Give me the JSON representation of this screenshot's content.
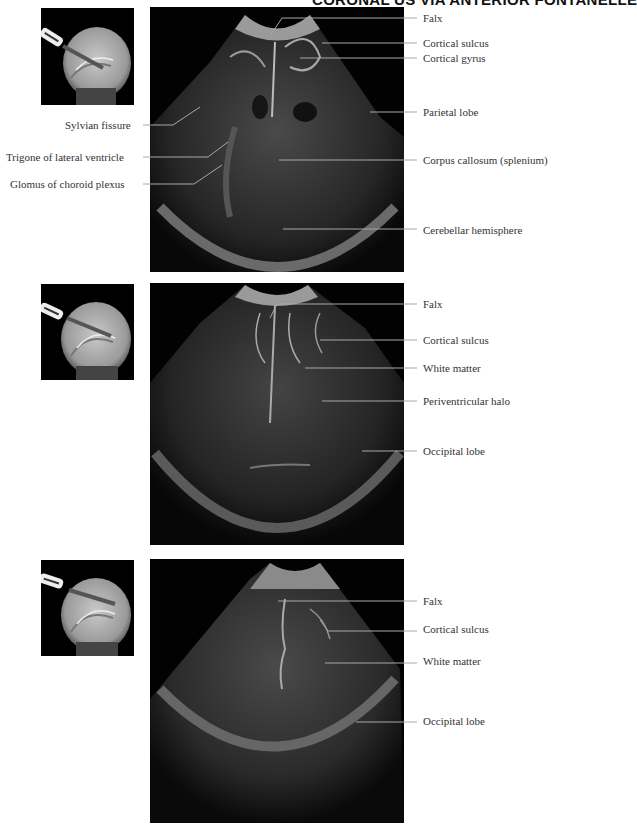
{
  "header": {
    "title": "CORONAL US VIA ANTERIOR FONTANELLE"
  },
  "figures": [
    {
      "left_labels": [
        "Sylvian fissure",
        "Trigone of lateral ventricle",
        "Glomus of choroid plexus"
      ],
      "right_labels": [
        "Falx",
        "Cortical sulcus",
        "Cortical gyrus",
        "Parietal lobe",
        "Corpus callosum (splenium)",
        "Cerebellar hemisphere"
      ]
    },
    {
      "right_labels": [
        "Falx",
        "Cortical sulcus",
        "White matter",
        "Periventricular halo",
        "Occipital lobe"
      ]
    },
    {
      "right_labels": [
        "Falx",
        "Cortical sulcus",
        "White matter",
        "Occipital lobe"
      ]
    }
  ],
  "icons": {
    "thumbnail": "sagittal-mri-probe-icon"
  }
}
